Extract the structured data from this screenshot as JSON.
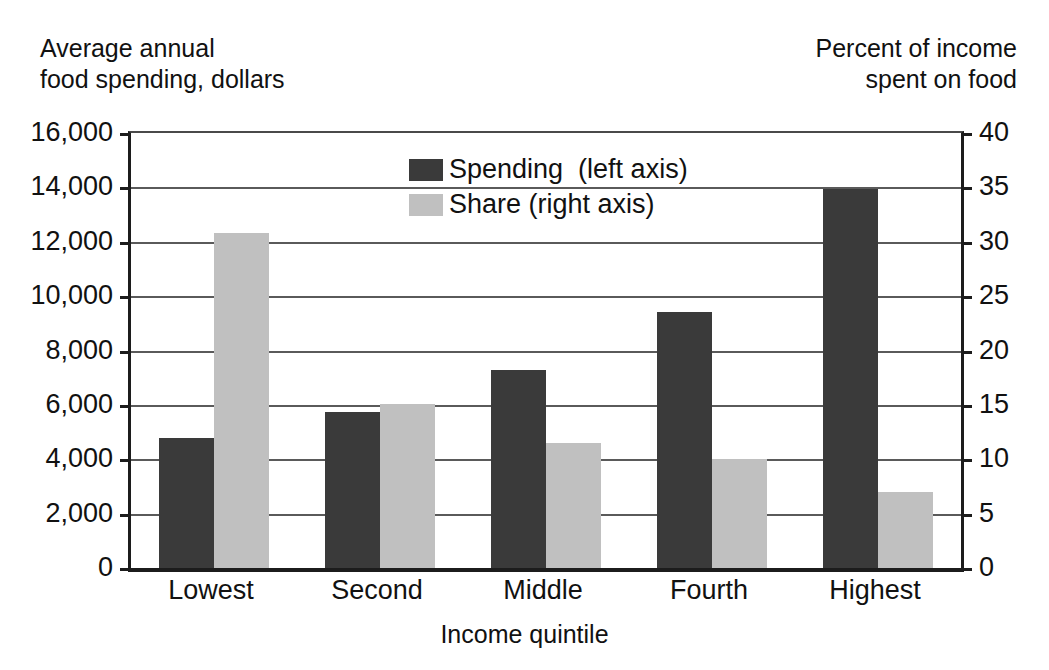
{
  "chart_data": {
    "type": "bar",
    "title": "",
    "subtitle": "",
    "categories": [
      "Lowest",
      "Second",
      "Middle",
      "Fourth",
      "Highest"
    ],
    "series": [
      {
        "name": "Spending  (left axis)",
        "axis": "left",
        "color": "#3a3a3a",
        "values": [
          4800,
          5750,
          7300,
          9400,
          13950
        ]
      },
      {
        "name": "Share (right axis)",
        "axis": "right",
        "color": "#c0c0c0",
        "values": [
          30.8,
          15.1,
          11.5,
          10.0,
          7.0
        ]
      }
    ],
    "xlabel": "Income  quintile",
    "ylabel": "Average annual\nfood spending,  dollars",
    "y2label": "Percent of income\nspent on food",
    "ylim": [
      0,
      16000
    ],
    "y2lim": [
      0,
      40
    ],
    "yticks": [
      0,
      2000,
      4000,
      6000,
      8000,
      10000,
      12000,
      14000,
      16000
    ],
    "ytick_labels": [
      "0",
      "2,000",
      "4,000",
      "6,000",
      "8,000",
      "10,000",
      "12,000",
      "14,000",
      "16,000"
    ],
    "y2ticks": [
      0,
      5,
      10,
      15,
      20,
      25,
      30,
      35,
      40
    ],
    "y2tick_labels": [
      "0",
      "5",
      "10",
      "15",
      "20",
      "25",
      "30",
      "35",
      "40"
    ],
    "grid": true,
    "grid_axis": "y",
    "legend_position": "top-center",
    "legend_entries": [
      "Spending  (left axis)",
      "Share (right axis)"
    ],
    "background_color": "#ffffff",
    "axis_color": "#1c1c1c",
    "gridline_color": "#5a5a5a"
  },
  "axes": {
    "left_title": "Average annual\nfood spending,  dollars",
    "right_title": "Percent of income\nspent on food",
    "x_title": "Income  quintile"
  },
  "legend": {
    "spending_label": "Spending  (left axis)",
    "share_label": "Share (right axis)"
  }
}
